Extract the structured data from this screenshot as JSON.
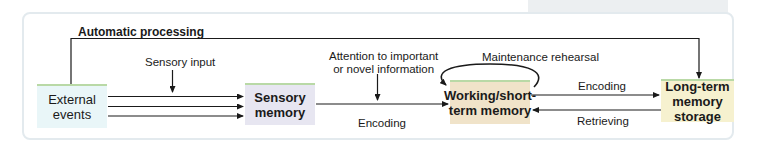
{
  "diagram": {
    "title": "",
    "nodes": [
      {
        "id": "external",
        "lines": [
          "External",
          "events"
        ],
        "fill": "#e9f6f8"
      },
      {
        "id": "sensory",
        "lines": [
          "Sensory",
          "memory"
        ],
        "fill": "#e7e6f1"
      },
      {
        "id": "working",
        "lines": [
          "Working/short-",
          "term memory"
        ],
        "fill": "#f0e3c9"
      },
      {
        "id": "longterm",
        "lines": [
          "Long-term",
          "memory storage"
        ],
        "fill": "#f6f1cf"
      }
    ],
    "labels": {
      "automatic": "Automatic processing",
      "sensory_input": "Sensory input",
      "attention_1": "Attention to important",
      "attention_2": "or novel information",
      "encoding_1": "Encoding",
      "maintenance": "Maintenance rehearsal",
      "encoding_2": "Encoding",
      "retrieving": "Retrieving"
    },
    "edges": [
      {
        "from": "external",
        "to": "sensory",
        "label": "",
        "count": 3
      },
      {
        "from": "external",
        "to": "longterm",
        "label": "Automatic processing"
      },
      {
        "from": "sensory",
        "to": "working",
        "label": "Encoding"
      },
      {
        "from": "working",
        "to": "working",
        "label": "Maintenance rehearsal"
      },
      {
        "from": "working",
        "to": "longterm",
        "label": "Encoding"
      },
      {
        "from": "longterm",
        "to": "working",
        "label": "Retrieving"
      }
    ],
    "colors": {
      "frame_border": "#e3eaee",
      "box_top_border": "#b9d9a6",
      "line": "#1a1a1a"
    }
  }
}
